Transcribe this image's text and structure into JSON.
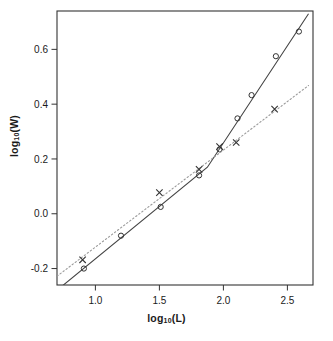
{
  "chart_data": {
    "type": "scatter",
    "title": "",
    "xlabel": "log10(L)",
    "ylabel": "log10(W)",
    "xlabel_base": "log",
    "xlabel_sub": "10",
    "xlabel_tail": "(L)",
    "ylabel_base": "log",
    "ylabel_sub": "10",
    "ylabel_tail": "(W)",
    "xlim": [
      0.7,
      2.7
    ],
    "ylim": [
      -0.26,
      0.74
    ],
    "xticks": [
      1.0,
      1.5,
      2.0,
      2.5
    ],
    "xticklabels": [
      "1.0",
      "1.5",
      "2.0",
      "2.5"
    ],
    "yticks": [
      -0.2,
      0.0,
      0.2,
      0.4,
      0.6
    ],
    "yticklabels": [
      "-0.2",
      "0.0",
      "0.2",
      "0.4",
      "0.6"
    ],
    "grid": false,
    "legend": "none",
    "series": [
      {
        "name": "circles",
        "marker": "circle",
        "line_style": "solid",
        "color": "#444444",
        "points": [
          {
            "x": 0.91,
            "y": -0.2
          },
          {
            "x": 1.2,
            "y": -0.08
          },
          {
            "x": 1.51,
            "y": 0.025
          },
          {
            "x": 1.81,
            "y": 0.14
          },
          {
            "x": 1.97,
            "y": 0.235
          },
          {
            "x": 2.11,
            "y": 0.348
          },
          {
            "x": 2.22,
            "y": 0.433
          },
          {
            "x": 2.41,
            "y": 0.575
          },
          {
            "x": 2.59,
            "y": 0.665
          }
        ],
        "fit_line": [
          {
            "x": 0.745,
            "y": -0.262
          },
          {
            "x": 1.875,
            "y": 0.17
          },
          {
            "x": 2.665,
            "y": 0.73
          }
        ]
      },
      {
        "name": "crosses",
        "marker": "x",
        "line_style": "dotted",
        "color": "#9a9a9a",
        "points": [
          {
            "x": 0.9,
            "y": -0.168
          },
          {
            "x": 1.5,
            "y": 0.077
          },
          {
            "x": 1.81,
            "y": 0.162
          },
          {
            "x": 1.97,
            "y": 0.245
          },
          {
            "x": 2.1,
            "y": 0.26
          },
          {
            "x": 2.4,
            "y": 0.382
          }
        ],
        "fit_line": [
          {
            "x": 0.7,
            "y": -0.228
          },
          {
            "x": 2.665,
            "y": 0.468
          }
        ]
      }
    ]
  }
}
